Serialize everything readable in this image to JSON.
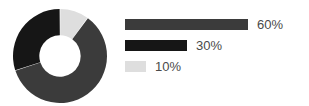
{
  "chart_data": {
    "type": "pie",
    "variant": "donut",
    "title": "",
    "subtitle": "",
    "xlabel": "",
    "ylabel": "",
    "grid": false,
    "legend_position": "right",
    "start_angle_deg": 0,
    "direction": "clockwise",
    "inner_radius_ratio": 0.44,
    "categories": [
      "60%",
      "30%",
      "10%"
    ],
    "values": [
      60,
      30,
      10
    ],
    "labels": [
      "60%",
      "30%",
      "10%"
    ],
    "colors": [
      "#3b3b3b",
      "#161616",
      "#dedede"
    ],
    "slices": [
      {
        "label": "10%",
        "value": 10,
        "color": "#dedede",
        "start_deg": 0,
        "end_deg": 36
      },
      {
        "label": "60%",
        "value": 60,
        "color": "#3b3b3b",
        "start_deg": 36,
        "end_deg": 252
      },
      {
        "label": "30%",
        "value": 30,
        "color": "#161616",
        "start_deg": 252,
        "end_deg": 360
      }
    ],
    "legend": [
      {
        "label": "60%",
        "value": 60,
        "color": "#3b3b3b",
        "bar_px": 123
      },
      {
        "label": "30%",
        "value": 30,
        "color": "#161616",
        "bar_px": 62
      },
      {
        "label": "10%",
        "value": 10,
        "color": "#dedede",
        "bar_px": 21
      }
    ]
  },
  "figure": {
    "background": "#ffffff",
    "text_color": "#4a4a4a"
  }
}
